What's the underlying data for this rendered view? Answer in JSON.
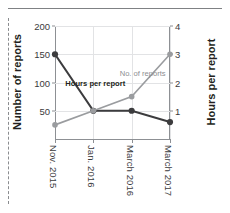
{
  "decor": {
    "top_rule": "horizontal-rule",
    "left_border": "dashed-vertical-rule"
  },
  "chart_data": {
    "type": "line",
    "title": "",
    "xlabel": "",
    "categories": [
      "Nov. 2015",
      "Jan. 2016",
      "March 2016",
      "March 2017"
    ],
    "grid": true,
    "legend": "inline-annotations",
    "axes": {
      "left": {
        "label": "Number of reports",
        "ticks": [
          50,
          100,
          150,
          200
        ],
        "ylim": [
          0,
          200
        ]
      },
      "right": {
        "label": "Hours per report",
        "ticks": [
          1,
          2,
          3,
          4
        ],
        "ylim": [
          0,
          4
        ]
      }
    },
    "series": [
      {
        "name": "Hours per report",
        "axis": "left",
        "color": "#3c3c3e",
        "values": [
          150,
          50,
          50,
          30
        ]
      },
      {
        "name": "No. of reports",
        "axis": "right",
        "color": "#9a9c9f",
        "values": [
          0.5,
          1.0,
          1.5,
          3.0
        ]
      }
    ],
    "annotations": [
      {
        "text": "Hours per report",
        "series": "Hours per report"
      },
      {
        "text": "No. of reports",
        "series": "No. of reports"
      }
    ]
  }
}
